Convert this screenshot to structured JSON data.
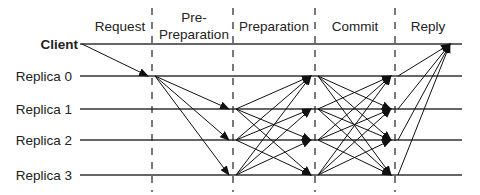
{
  "phases": [
    {
      "id": "request",
      "label": "Request"
    },
    {
      "id": "pre-preparation",
      "label_lines": [
        "Pre-",
        "Preparation"
      ]
    },
    {
      "id": "preparation",
      "label": "Preparation"
    },
    {
      "id": "commit",
      "label": "Commit"
    },
    {
      "id": "reply",
      "label": "Reply"
    }
  ],
  "nodes": [
    {
      "id": "client",
      "label": "Client",
      "bold": true
    },
    {
      "id": "replica0",
      "label": "Replica 0",
      "bold": false
    },
    {
      "id": "replica1",
      "label": "Replica 1",
      "bold": false
    },
    {
      "id": "replica2",
      "label": "Replica 2",
      "bold": false
    },
    {
      "id": "replica3",
      "label": "Replica 3",
      "bold": false
    }
  ],
  "messages": [
    {
      "phase": "request",
      "from": "client",
      "to": [
        "replica0"
      ]
    },
    {
      "phase": "pre-preparation",
      "from": "replica0",
      "to": [
        "replica1",
        "replica2",
        "replica3"
      ]
    },
    {
      "phase": "preparation",
      "from": "replica1",
      "to": [
        "replica0",
        "replica2",
        "replica3"
      ]
    },
    {
      "phase": "preparation",
      "from": "replica2",
      "to": [
        "replica0",
        "replica1",
        "replica3"
      ]
    },
    {
      "phase": "preparation",
      "from": "replica3",
      "to": [
        "replica0",
        "replica1",
        "replica2"
      ]
    },
    {
      "phase": "commit",
      "from": "replica0",
      "to": [
        "replica1",
        "replica2",
        "replica3"
      ]
    },
    {
      "phase": "commit",
      "from": "replica1",
      "to": [
        "replica0",
        "replica2",
        "replica3"
      ]
    },
    {
      "phase": "commit",
      "from": "replica2",
      "to": [
        "replica0",
        "replica1",
        "replica3"
      ]
    },
    {
      "phase": "commit",
      "from": "replica3",
      "to": [
        "replica0",
        "replica1",
        "replica2"
      ]
    },
    {
      "phase": "reply",
      "from": "replica0",
      "to": [
        "client"
      ]
    },
    {
      "phase": "reply",
      "from": "replica1",
      "to": [
        "client"
      ]
    },
    {
      "phase": "reply",
      "from": "replica2",
      "to": [
        "client"
      ]
    },
    {
      "phase": "reply",
      "from": "replica3",
      "to": [
        "client"
      ]
    }
  ]
}
